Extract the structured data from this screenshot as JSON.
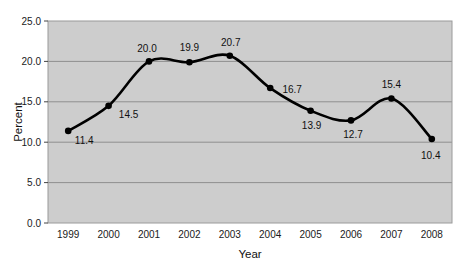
{
  "chart_data": {
    "type": "line",
    "title": "",
    "xlabel": "Year",
    "ylabel": "Percent",
    "categories": [
      "1999",
      "2000",
      "2001",
      "2002",
      "2003",
      "2004",
      "2005",
      "2006",
      "2007",
      "2008"
    ],
    "values": [
      11.4,
      14.5,
      20.0,
      19.9,
      20.7,
      16.7,
      13.9,
      12.7,
      15.4,
      10.4
    ],
    "point_labels": [
      "11.4",
      "14.5",
      "20.0",
      "19.9",
      "20.7",
      "16.7",
      "13.9",
      "12.7",
      "15.4",
      "10.4"
    ],
    "ylim": [
      0.0,
      25.0
    ],
    "ytick_values": [
      0.0,
      5.0,
      10.0,
      15.0,
      20.0,
      25.0
    ],
    "ytick_labels": [
      "0.0",
      "5.0",
      "10.0",
      "15.0",
      "20.0",
      "25.0"
    ],
    "xtick_labels": [
      "1999",
      "2000",
      "2001",
      "2002",
      "2003",
      "2004",
      "2005",
      "2006",
      "2007",
      "2008"
    ],
    "grid": true,
    "legend": false,
    "legend_position": "none",
    "series": [
      {
        "name": "Percent",
        "values": [
          11.4,
          14.5,
          20.0,
          19.9,
          20.7,
          16.7,
          13.9,
          12.7,
          15.4,
          10.4
        ],
        "line_color": "#000000",
        "marker": "circle",
        "marker_color": "#000000",
        "smoothed": true
      }
    ],
    "colors": {
      "plot_background": "#cdcdcd",
      "gridline": "#8f8f8f",
      "plot_border": "#9a9a9a",
      "line": "#000000",
      "marker": "#000000",
      "text": "#111111",
      "page_background": "#ffffff"
    },
    "label_offsets": [
      {
        "label": "11.4",
        "dx": 16,
        "dy": 13
      },
      {
        "label": "14.5",
        "dx": 20,
        "dy": 12
      },
      {
        "label": "20.0",
        "dx": -2,
        "dy": -9
      },
      {
        "label": "19.9",
        "dx": 0,
        "dy": -11
      },
      {
        "label": "20.7",
        "dx": 1,
        "dy": -10
      },
      {
        "label": "16.7",
        "dx": 22,
        "dy": 5
      },
      {
        "label": "13.9",
        "dx": 1,
        "dy": 18
      },
      {
        "label": "12.7",
        "dx": 2,
        "dy": 18
      },
      {
        "label": "15.4",
        "dx": 0,
        "dy": -11
      },
      {
        "label": "10.4",
        "dx": -1,
        "dy": 20
      }
    ]
  }
}
